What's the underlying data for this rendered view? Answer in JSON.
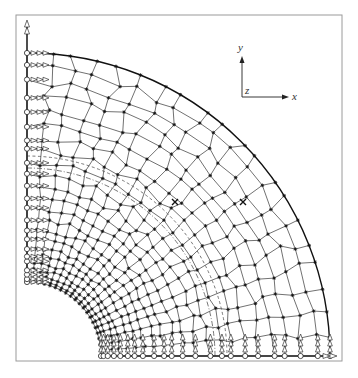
{
  "figure": {
    "type": "finite-element-mesh",
    "colors": {
      "line": "#333333",
      "frame": "#9a9a9a",
      "background": "#ffffff"
    },
    "frame": {
      "x": 16,
      "y": 15,
      "width": 326,
      "height": 346
    },
    "geometry": {
      "center": [
        27,
        356
      ],
      "inner_radius": 74,
      "outer_radius": 303,
      "radial_divisions": 22,
      "angular_divisions": 20,
      "dashed_radius": 200,
      "dashdot_radius": 188
    },
    "coordinate_system": {
      "origin": [
        242,
        97
      ],
      "x_label": "x",
      "y_label": "y",
      "z_label": "z"
    },
    "markers": [
      {
        "symbol": "×",
        "x": 243,
        "y": 202
      },
      {
        "symbol": "×",
        "x": 175,
        "y": 202
      }
    ],
    "boundary_conditions": {
      "left_edge": "rollers (circles) with x-direction arrows",
      "bottom_edge": "rollers (circles) with y-direction arrows",
      "y_axis_end": "double arrow up",
      "x_axis_end": "double arrow right"
    }
  }
}
